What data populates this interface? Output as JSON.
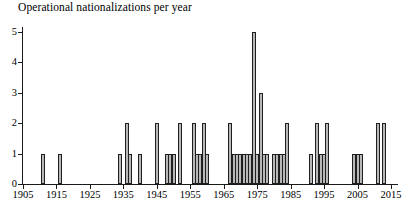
{
  "chart_data": {
    "type": "bar",
    "title": "Operational nationalizations per year",
    "xlabel": "",
    "ylabel": "",
    "xlim": [
      1905,
      2015
    ],
    "ylim": [
      0,
      5
    ],
    "grid": false,
    "legend": null,
    "bar_color": "#b8b8b8",
    "bar_edge_color": "#1f1f1f",
    "axis_color": "#1a1a1a",
    "yticks": [
      0,
      1,
      2,
      3,
      4,
      5
    ],
    "ytick_labels": [
      "0",
      "1",
      "2",
      "3",
      "4",
      "5"
    ],
    "xticks": [
      1905,
      1915,
      1925,
      1935,
      1945,
      1955,
      1965,
      1975,
      1985,
      1995,
      2005,
      2015
    ],
    "xtick_labels": [
      "1905",
      "1915",
      "1925",
      "1935",
      "1945",
      "1955",
      "1965",
      "1975",
      "1985",
      "1995",
      "2005",
      "2015"
    ],
    "x": [
      1911,
      1916,
      1934,
      1936,
      1937,
      1940,
      1945,
      1948,
      1949,
      1950,
      1952,
      1956,
      1957,
      1958,
      1959,
      1960,
      1967,
      1968,
      1969,
      1970,
      1971,
      1972,
      1973,
      1974,
      1975,
      1976,
      1977,
      1978,
      1980,
      1981,
      1982,
      1983,
      1984,
      1991,
      1993,
      1994,
      1995,
      1996,
      2004,
      2005,
      2006,
      2011,
      2013
    ],
    "values": [
      1,
      1,
      1,
      2,
      1,
      1,
      2,
      1,
      1,
      1,
      2,
      2,
      1,
      1,
      2,
      1,
      2,
      1,
      1,
      1,
      1,
      1,
      1,
      5,
      1,
      3,
      1,
      1,
      1,
      1,
      1,
      1,
      2,
      1,
      2,
      1,
      1,
      2,
      1,
      1,
      1,
      2,
      2
    ]
  }
}
